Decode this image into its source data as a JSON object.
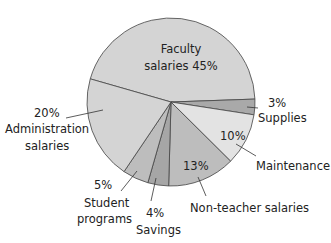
{
  "chart_data": {
    "type": "pie",
    "title": "",
    "slices": [
      {
        "label": "Faculty salaries",
        "value": 45,
        "color": "#d4d4d4"
      },
      {
        "label": "Supplies",
        "value": 3,
        "color": "#a9a9a9"
      },
      {
        "label": "Maintenance",
        "value": 10,
        "color": "#e3e3e3"
      },
      {
        "label": "Non-teacher salaries",
        "value": 13,
        "color": "#bdbdbd"
      },
      {
        "label": "Savings",
        "value": 4,
        "color": "#a6a6a6"
      },
      {
        "label": "Student programs",
        "value": 5,
        "color": "#bdbdbd"
      },
      {
        "label": "Administration salaries",
        "value": 20,
        "color": "#d4d4d4"
      }
    ]
  },
  "labels": {
    "faculty_1": "Faculty",
    "faculty_2": "salaries 45%",
    "supplies_pct": "3%",
    "supplies": "Supplies",
    "maint_pct": "10%",
    "maint": "Maintenance",
    "nonteacher_pct": "13%",
    "nonteacher": "Non-teacher salaries",
    "savings_pct": "4%",
    "savings": "Savings",
    "student_pct": "5%",
    "student_1": "Student",
    "student_2": "programs",
    "admin_pct": "20%",
    "admin_1": "Administration",
    "admin_2": "salaries"
  }
}
